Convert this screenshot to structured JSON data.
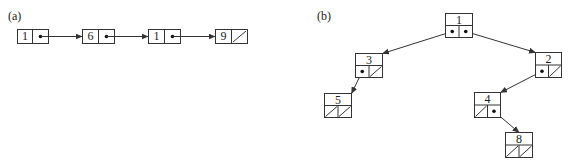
{
  "panel_a": {
    "label": "(a)",
    "label_pos": [
      8,
      20
    ],
    "nodes": [
      {
        "value": "1",
        "x": 17,
        "y": 29,
        "w": 31,
        "h": 14,
        "split": 32,
        "next": "pointer"
      },
      {
        "value": "6",
        "x": 82,
        "y": 29,
        "w": 32,
        "h": 14,
        "split": 98,
        "next": "pointer"
      },
      {
        "value": "1",
        "x": 148,
        "y": 29,
        "w": 32,
        "h": 14,
        "split": 164,
        "next": "pointer"
      },
      {
        "value": "9",
        "x": 215,
        "y": 29,
        "w": 32,
        "h": 14,
        "split": 231,
        "next": "null"
      }
    ]
  },
  "panel_b": {
    "label": "(b)",
    "label_pos": [
      317,
      20
    ],
    "nodes": [
      {
        "id": "n1",
        "value": "1",
        "x": 445,
        "y": 13,
        "w": 27,
        "h": 24,
        "left": "pointer",
        "right": "pointer"
      },
      {
        "id": "n3",
        "value": "3",
        "x": 355,
        "y": 53,
        "w": 27,
        "h": 24,
        "left": "pointer",
        "right": "null"
      },
      {
        "id": "n2",
        "value": "2",
        "x": 535,
        "y": 52,
        "w": 26,
        "h": 25,
        "left": "pointer",
        "right": "null"
      },
      {
        "id": "n5",
        "value": "5",
        "x": 324,
        "y": 93,
        "w": 27,
        "h": 24,
        "left": "null",
        "right": "null"
      },
      {
        "id": "n4",
        "value": "4",
        "x": 474,
        "y": 92,
        "w": 26,
        "h": 25,
        "left": "null",
        "right": "pointer"
      },
      {
        "id": "n8",
        "value": "8",
        "x": 505,
        "y": 132,
        "w": 27,
        "h": 25,
        "left": "null",
        "right": "null"
      }
    ],
    "edges": [
      {
        "from": "n1",
        "side": "left",
        "to": "n3"
      },
      {
        "from": "n1",
        "side": "right",
        "to": "n2"
      },
      {
        "from": "n3",
        "side": "left",
        "to": "n5"
      },
      {
        "from": "n2",
        "side": "left",
        "to": "n4"
      },
      {
        "from": "n4",
        "side": "right",
        "to": "n8"
      }
    ]
  },
  "colors": {
    "stroke": "#333333",
    "background": "#ffffff",
    "text": "#222222"
  }
}
